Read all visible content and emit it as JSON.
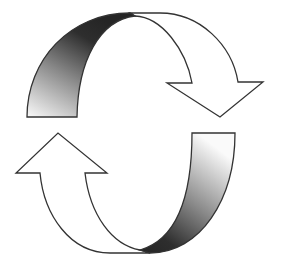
{
  "diagram": {
    "type": "cycle-arrows",
    "arrows": [
      {
        "id": "top",
        "direction": "clockwise-down-right",
        "shaded_band": "left"
      },
      {
        "id": "bottom",
        "direction": "clockwise-up-left",
        "shaded_band": "right"
      }
    ],
    "colors": {
      "outline": "#333333",
      "fill": "#ffffff",
      "shade_dark": "#2a2a2a",
      "shade_light": "#f2f2f2"
    }
  }
}
